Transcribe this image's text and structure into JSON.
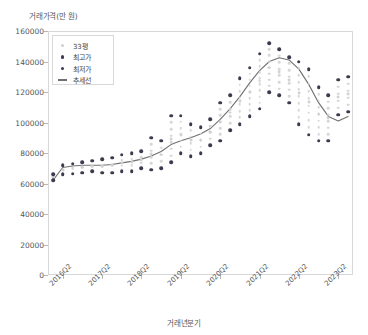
{
  "chart_data": {
    "type": "scatter",
    "title": "",
    "ylabel": "거래가격(만 원)",
    "xlabel": "거래년분기",
    "ylim": [
      0,
      160000
    ],
    "yticks": [
      0,
      20000,
      40000,
      60000,
      80000,
      100000,
      120000,
      140000,
      160000
    ],
    "ytick_labels": [
      "0",
      "20000",
      "40000",
      "60000",
      "80000",
      "100000",
      "120000",
      "140000",
      "160000"
    ],
    "xtick_labels": [
      "2016Q2",
      "2017Q2",
      "2018Q2",
      "2019Q2",
      "2020Q2",
      "2021Q2",
      "2022Q2",
      "2023Q2"
    ],
    "grid": false,
    "legend_position": "upper-left",
    "colors": {
      "scatter_33py": "#d0d0d0",
      "max_price": "#3b3b4e",
      "min_price": "#3b3b4e",
      "trend_line": "#707070",
      "axis": "#d8d8d8",
      "text": "#555555"
    },
    "legend": [
      {
        "label": "33평",
        "marker": "dot",
        "color": "#d0d0d0"
      },
      {
        "label": "최고가",
        "marker": "dot",
        "color": "#3b3b4e"
      },
      {
        "label": "최저가",
        "marker": "dot",
        "color": "#3b3b4e"
      },
      {
        "label": "추세선",
        "marker": "line",
        "color": "#707070"
      }
    ],
    "x_categories": [
      "2016Q1",
      "2016Q2",
      "2016Q3",
      "2016Q4",
      "2017Q1",
      "2017Q2",
      "2017Q3",
      "2017Q4",
      "2018Q1",
      "2018Q2",
      "2018Q3",
      "2018Q4",
      "2019Q1",
      "2019Q2",
      "2019Q3",
      "2019Q4",
      "2020Q1",
      "2020Q2",
      "2020Q3",
      "2020Q4",
      "2021Q1",
      "2021Q2",
      "2021Q3",
      "2021Q4",
      "2022Q1",
      "2022Q2",
      "2022Q3",
      "2022Q4",
      "2023Q1",
      "2023Q2",
      "2023Q3"
    ],
    "series": [
      {
        "name": "최고가",
        "marker": "dot",
        "color": "#3b3b4e",
        "values": [
          66000,
          72000,
          73000,
          74000,
          75000,
          76000,
          77000,
          79000,
          80000,
          81000,
          90000,
          88000,
          104500,
          104500,
          99000,
          97000,
          102000,
          113000,
          118000,
          129000,
          136000,
          145000,
          152000,
          148000,
          143000,
          140000,
          135000,
          123000,
          118000,
          128000,
          130000
        ]
      },
      {
        "name": "최저가",
        "marker": "dot",
        "color": "#3b3b4e",
        "values": [
          62000,
          66000,
          66500,
          67000,
          68000,
          67000,
          67000,
          68000,
          68000,
          70000,
          69000,
          70000,
          74000,
          80000,
          78000,
          80000,
          85000,
          88000,
          95000,
          99000,
          104000,
          109000,
          120000,
          118000,
          113000,
          99000,
          92000,
          88000,
          88000,
          105000,
          107000
        ]
      },
      {
        "name": "33평",
        "marker": "dot",
        "color": "#d0d0d0",
        "values": [
          64000,
          69000,
          70000,
          70500,
          71500,
          71500,
          72000,
          73500,
          74000,
          75500,
          79500,
          79000,
          89000,
          92000,
          88500,
          88500,
          93500,
          100500,
          106500,
          114000,
          120000,
          127000,
          136000,
          133000,
          128000,
          119500,
          113500,
          105500,
          103000,
          116500,
          118500
        ]
      }
    ],
    "trend_line": {
      "name": "추세선",
      "color": "#707070",
      "values": [
        62000,
        70500,
        71500,
        72000,
        72000,
        72000,
        72500,
        73500,
        74500,
        76000,
        78000,
        81000,
        85500,
        88000,
        90000,
        92500,
        96000,
        102000,
        109000,
        117000,
        126000,
        134000,
        140000,
        142500,
        141000,
        135000,
        125000,
        113000,
        104000,
        101000,
        104000
      ]
    }
  }
}
